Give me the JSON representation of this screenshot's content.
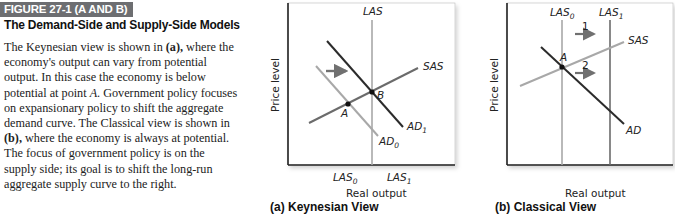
{
  "figure": {
    "tag": "FIGURE 27-1 (A AND B)",
    "title": "The Demand-Side and Supply-Side Models",
    "body": [
      {
        "t": "The Keynesian view is shown in ",
        "s": ""
      },
      {
        "t": "(a),",
        "s": "b"
      },
      {
        "t": " where the economy's output can vary from potential output. In this case the economy is below potential at point ",
        "s": ""
      },
      {
        "t": "A",
        "s": "i"
      },
      {
        "t": ". Government policy focuses on expansionary policy to shift the aggregate demand curve. The Classical view is shown in ",
        "s": ""
      },
      {
        "t": "(b),",
        "s": "b"
      },
      {
        "t": " where the economy is always at potential. The focus of government policy is on the supply side; its goal is to shift the long-run aggregate supply curve to the right.",
        "s": ""
      }
    ]
  },
  "panels": {
    "a": {
      "title": "(a)  Keynesian View",
      "y_label": "Price level",
      "x_label": "Real output",
      "curve_labels": {
        "las": "LAS",
        "sas": "SAS",
        "ad1": "AD",
        "ad1_sub": "1",
        "ad0": "AD",
        "ad0_sub": "0"
      },
      "points": {
        "a": "A",
        "b": "B"
      },
      "x_ticks": [
        {
          "label": "LAS",
          "sub": "0"
        },
        {
          "label": "LAS",
          "sub": "1"
        }
      ]
    },
    "b": {
      "title": "(b)  Classical View",
      "y_label": "Price level",
      "x_label": "Real output",
      "curve_labels": {
        "las0": "LAS",
        "las0_sub": "0",
        "las1": "LAS",
        "las1_sub": "1",
        "sas": "SAS",
        "ad": "AD"
      },
      "points": {
        "a": "A"
      },
      "arrows": [
        "1",
        "2"
      ]
    }
  },
  "colors": {
    "dark_line": "#2b2b2b",
    "mid_line": "#6b6b6b",
    "light_line": "#a8a8a8",
    "arrow": "#707070",
    "tag_bg": "#6d6e71"
  }
}
